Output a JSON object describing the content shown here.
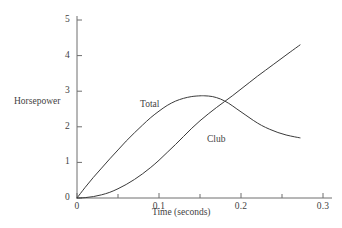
{
  "chart_data": {
    "type": "line",
    "title": "",
    "xlabel": "Time (seconds)",
    "ylabel": "Horsepower",
    "xlim": [
      0,
      0.3
    ],
    "ylim": [
      0,
      5.2
    ],
    "grid": false,
    "legend_position": "inline-curve-labels",
    "x_ticks": [
      {
        "value": 0,
        "label": "0",
        "major": true
      },
      {
        "value": 0.05,
        "label": "",
        "major": false
      },
      {
        "value": 0.1,
        "label": "0.1",
        "major": true
      },
      {
        "value": 0.15,
        "label": "",
        "major": false
      },
      {
        "value": 0.2,
        "label": "0.2",
        "major": true
      },
      {
        "value": 0.25,
        "label": "",
        "major": false
      },
      {
        "value": 0.3,
        "label": "0.3",
        "major": true
      }
    ],
    "y_ticks": [
      {
        "value": 0,
        "label": "0"
      },
      {
        "value": 1,
        "label": "1"
      },
      {
        "value": 2,
        "label": "2"
      },
      {
        "value": 3,
        "label": "3"
      },
      {
        "value": 4,
        "label": "4"
      },
      {
        "value": 5,
        "label": "5"
      }
    ],
    "series": [
      {
        "name": "Total",
        "label": "Total",
        "color": "#3a3a3a",
        "points": [
          [
            0.0,
            0.0
          ],
          [
            0.01,
            0.3
          ],
          [
            0.02,
            0.58
          ],
          [
            0.03,
            0.84
          ],
          [
            0.04,
            1.1
          ],
          [
            0.05,
            1.35
          ],
          [
            0.06,
            1.6
          ],
          [
            0.07,
            1.83
          ],
          [
            0.08,
            2.05
          ],
          [
            0.09,
            2.26
          ],
          [
            0.1,
            2.44
          ],
          [
            0.11,
            2.6
          ],
          [
            0.12,
            2.72
          ],
          [
            0.13,
            2.8
          ],
          [
            0.14,
            2.85
          ],
          [
            0.15,
            2.87
          ],
          [
            0.156,
            2.87
          ],
          [
            0.165,
            2.85
          ],
          [
            0.175,
            2.78
          ],
          [
            0.185,
            2.66
          ],
          [
            0.195,
            2.5
          ],
          [
            0.205,
            2.34
          ],
          [
            0.215,
            2.18
          ],
          [
            0.225,
            2.04
          ],
          [
            0.235,
            1.93
          ],
          [
            0.245,
            1.84
          ],
          [
            0.255,
            1.77
          ],
          [
            0.265,
            1.72
          ],
          [
            0.272,
            1.69
          ]
        ]
      },
      {
        "name": "Club",
        "label": "Club",
        "color": "#3a3a3a",
        "points": [
          [
            0.0,
            0.0
          ],
          [
            0.01,
            0.01
          ],
          [
            0.02,
            0.04
          ],
          [
            0.03,
            0.09
          ],
          [
            0.04,
            0.16
          ],
          [
            0.05,
            0.26
          ],
          [
            0.06,
            0.38
          ],
          [
            0.07,
            0.52
          ],
          [
            0.08,
            0.68
          ],
          [
            0.09,
            0.86
          ],
          [
            0.1,
            1.06
          ],
          [
            0.11,
            1.28
          ],
          [
            0.12,
            1.5
          ],
          [
            0.13,
            1.73
          ],
          [
            0.14,
            1.96
          ],
          [
            0.15,
            2.17
          ],
          [
            0.16,
            2.36
          ],
          [
            0.17,
            2.54
          ],
          [
            0.18,
            2.71
          ],
          [
            0.19,
            2.88
          ],
          [
            0.2,
            3.06
          ],
          [
            0.21,
            3.24
          ],
          [
            0.22,
            3.42
          ],
          [
            0.23,
            3.59
          ],
          [
            0.24,
            3.76
          ],
          [
            0.25,
            3.93
          ],
          [
            0.26,
            4.1
          ],
          [
            0.272,
            4.3
          ]
        ]
      }
    ]
  }
}
